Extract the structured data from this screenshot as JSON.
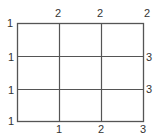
{
  "diagram": {
    "type": "grid-number-puzzle",
    "rows": 3,
    "cols": 3,
    "line_color": "#555555",
    "label_color": "#333333",
    "corner_label": "1",
    "top_labels": [
      "2",
      "2",
      "2"
    ],
    "left_labels": [
      "1",
      "1",
      "1"
    ],
    "right_labels": [
      "3",
      "3"
    ],
    "bottom_labels": [
      "1",
      "2",
      "3"
    ]
  }
}
